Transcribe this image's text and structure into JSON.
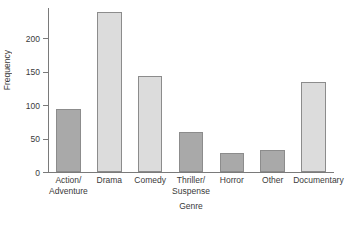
{
  "chart_data": {
    "type": "bar",
    "title": "",
    "subtitle": "",
    "xlabel": "Genre",
    "ylabel": "Frequency",
    "categories": [
      "Action/ Adventure",
      "Drama",
      "Comedy",
      "Thriller/ Suspense",
      "Horror",
      "Other",
      "Documentary"
    ],
    "category_lines": [
      [
        "Action/",
        "Adventure"
      ],
      [
        "Drama",
        ""
      ],
      [
        "Comedy",
        ""
      ],
      [
        "Thriller/",
        "Suspense"
      ],
      [
        "Horror",
        ""
      ],
      [
        "Other",
        ""
      ],
      [
        "Documentary",
        ""
      ]
    ],
    "values": [
      94,
      239,
      143,
      60,
      29,
      33,
      134
    ],
    "bar_shades": [
      "dark",
      "light",
      "light",
      "dark",
      "dark",
      "dark",
      "light"
    ],
    "ylim": [
      0,
      245
    ],
    "yticks": [
      0,
      50,
      100,
      150,
      200
    ],
    "ytick_labels": [
      "0",
      "50",
      "100",
      "150",
      "200"
    ],
    "grid": false,
    "legend": "none",
    "colors": {
      "bar_dark": "#a9a9a9",
      "bar_light": "#dcdcdc",
      "bar_edge": "#8c8c8c",
      "axis": "#7a7a7a",
      "text": "#3a3a3a",
      "background": "#ffffff"
    }
  }
}
